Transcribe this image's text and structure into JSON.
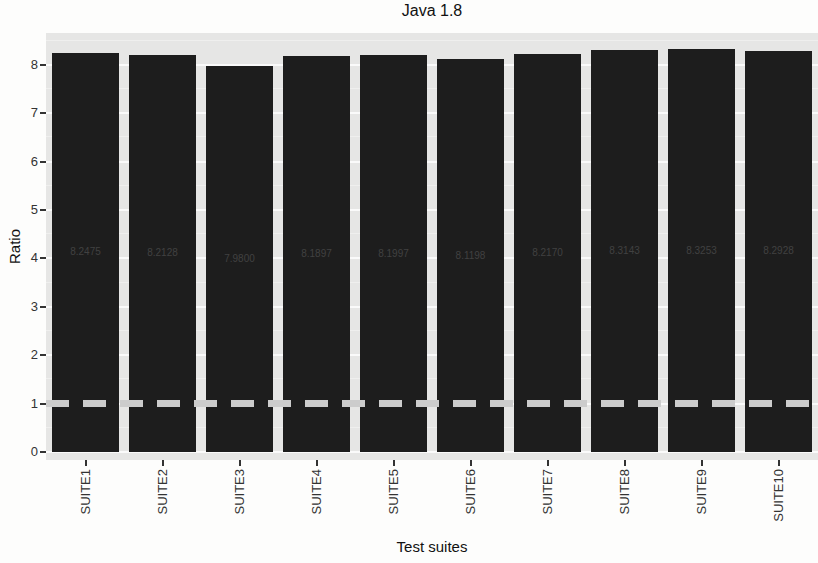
{
  "title": "Java 1.8",
  "chart_data": {
    "type": "bar",
    "title": "Java 1.8",
    "xlabel": "Test suites",
    "ylabel": "Ratio",
    "categories": [
      "SUITE1",
      "SUITE2",
      "SUITE3",
      "SUITE4",
      "SUITE5",
      "SUITE6",
      "SUITE7",
      "SUITE8",
      "SUITE9",
      "SUITE10"
    ],
    "values": [
      8.2475,
      8.2128,
      7.98,
      8.1897,
      8.1997,
      8.1198,
      8.217,
      8.3143,
      8.3253,
      8.2928
    ],
    "bar_value_labels": [
      "8.2475",
      "8.2128",
      "7.9800",
      "8.1897",
      "8.1997",
      "8.1198",
      "8.2170",
      "8.3143",
      "8.3253",
      "8.2928"
    ],
    "yticks": [
      0,
      1,
      2,
      3,
      4,
      5,
      6,
      7,
      8
    ],
    "ylim": [
      0,
      8.66
    ],
    "grid": "major-and-minor",
    "legend_position": "none",
    "reference_line": {
      "y": 1,
      "style": "dashed"
    },
    "colors": {
      "bar": "#1d1d1d",
      "panel_bg": "#e6e6e5",
      "grid_major": "#fafafa",
      "grid_minor": "#efefee",
      "reference_line": "#cccccc",
      "bar_label": "#414141",
      "axis_text": "#333333",
      "title_text": "#111111"
    }
  }
}
